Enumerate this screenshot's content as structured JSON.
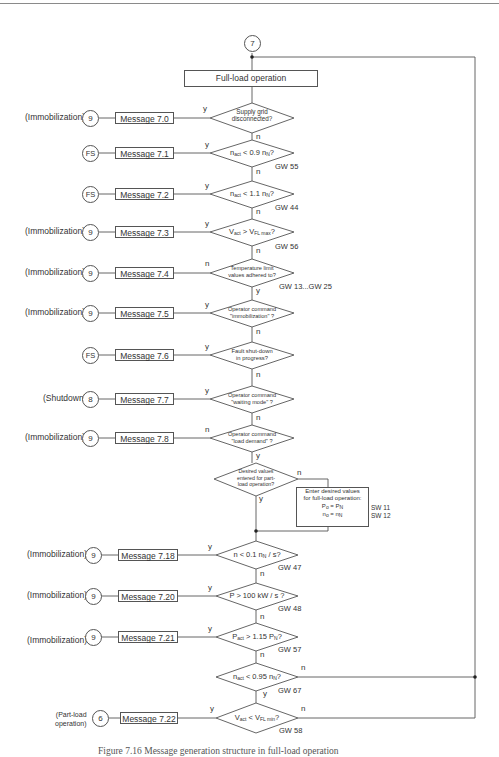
{
  "top_connector": {
    "label": "7"
  },
  "start_box": {
    "label": "Full-load operation"
  },
  "decisions": [
    {
      "id": "d0",
      "text_lines": [
        "Supply grid",
        "disconnected?"
      ],
      "left_branch": "y",
      "down_branch": "n",
      "ref": ""
    },
    {
      "id": "d1",
      "text_html": "n_act < 0.9 n_N?",
      "left_branch": "y",
      "down_branch": "n",
      "ref": "GW 55"
    },
    {
      "id": "d2",
      "text_html": "n_act < 1.1 n_N?",
      "left_branch": "y",
      "down_branch": "n",
      "ref": "GW 44"
    },
    {
      "id": "d3",
      "text_html": "V_act > V_FL max?",
      "left_branch": "y",
      "down_branch": "n",
      "ref": "GW 56"
    },
    {
      "id": "d4",
      "text_lines": [
        "Temperature limit",
        "values adhered to?"
      ],
      "left_branch": "n",
      "down_branch": "y",
      "ref": "GW 13...GW 25"
    },
    {
      "id": "d5",
      "text_lines": [
        "Operator command",
        "\"immobilization\" ?"
      ],
      "left_branch": "y",
      "down_branch": "n",
      "ref": ""
    },
    {
      "id": "d6",
      "text_lines": [
        "Fault shut-down",
        "in progress?"
      ],
      "left_branch": "y",
      "down_branch": "n",
      "ref": ""
    },
    {
      "id": "d7",
      "text_lines": [
        "Operator command",
        "\"waiting mode\" ?"
      ],
      "left_branch": "y",
      "down_branch": "n",
      "ref": ""
    },
    {
      "id": "d8",
      "text_lines": [
        "Operator command",
        "\"load demand\" ?"
      ],
      "left_branch": "n",
      "down_branch": "y",
      "ref": ""
    },
    {
      "id": "d9",
      "text_lines": [
        "Desired values",
        "entered for part-",
        "load operation?"
      ],
      "right_branch": "n",
      "down_branch": "y",
      "ref": ""
    },
    {
      "id": "d10",
      "text_html": "n < 0.1 n_N / s?",
      "left_branch": "y",
      "down_branch": "n",
      "ref": "GW 47"
    },
    {
      "id": "d11",
      "text_html": "P > 100 kW / s ?",
      "left_branch": "y",
      "down_branch": "n",
      "ref": "GW 48"
    },
    {
      "id": "d12",
      "text_html": "P_act > 1.15 P_N?",
      "left_branch": "y",
      "down_branch": "n",
      "ref": "GW 57"
    },
    {
      "id": "d13",
      "text_html": "n_act < 0.95 n_N?",
      "right_branch": "n",
      "down_branch": "y",
      "ref": "GW 67"
    },
    {
      "id": "d14",
      "text_html": "V_act < V_FL min?",
      "left_branch": "y",
      "right_branch": "n",
      "ref": "GW 58"
    }
  ],
  "messages": [
    {
      "label": "Message   7.0",
      "target": "9",
      "target_label": "(Immobilization)"
    },
    {
      "label": "Message   7.1",
      "target": "FS",
      "target_label": ""
    },
    {
      "label": "Message   7.2",
      "target": "FS",
      "target_label": ""
    },
    {
      "label": "Message   7.3",
      "target": "9",
      "target_label": "(Immobilization)"
    },
    {
      "label": "Message   7.4",
      "target": "9",
      "target_label": "(Immobilization)"
    },
    {
      "label": "Message   7.5",
      "target": "9",
      "target_label": "(Immobilization)"
    },
    {
      "label": "Message   7.6",
      "target": "FS",
      "target_label": ""
    },
    {
      "label": "Message   7.7",
      "target": "8",
      "target_label": "(Shutdown)"
    },
    {
      "label": "Message   7.8",
      "target": "9",
      "target_label": "(Immobilization)"
    },
    {
      "label": "Message   7.18",
      "target": "9",
      "target_label": "(Immobilization)"
    },
    {
      "label": "Message   7.20",
      "target": "9",
      "target_label": "(Immobilization)"
    },
    {
      "label": "Message   7.21",
      "target": "9",
      "target_label": "(Immobilization)"
    },
    {
      "label": "Message   7.22",
      "target": "6",
      "target_label_lines": [
        "(Part-load",
        "operation)"
      ]
    }
  ],
  "enter_box": {
    "lines": [
      "Enter desired values",
      "for full-load operation:",
      "P_o = P_N",
      "n_o = n_N"
    ],
    "refs": [
      "SW 11",
      "SW 12"
    ]
  },
  "caption": "Figure 7.16  Message generation structure in full-load operation"
}
